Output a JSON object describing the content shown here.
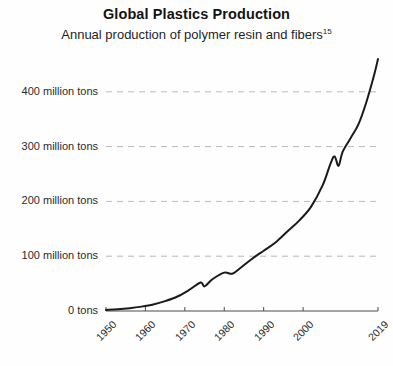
{
  "header": {
    "title": "Global Plastics Production",
    "subtitle_text": "Annual production of polymer resin and fibers",
    "subtitle_footnote": "15"
  },
  "colors": {
    "line": "#1a1a1a",
    "grid": "#b9b9b9",
    "axis": "#4a4a4a",
    "background": "#fefefe",
    "text": "#1f1f1f"
  },
  "chart_data": {
    "type": "line",
    "title": "Global Plastics Production",
    "subtitle": "Annual production of polymer resin and fibers",
    "xlabel": "",
    "ylabel": "",
    "xlim": [
      1950,
      2019
    ],
    "ylim": [
      0,
      460
    ],
    "grid": true,
    "legend": null,
    "y_tick_values": [
      0,
      100,
      200,
      300,
      400
    ],
    "y_tick_labels": [
      "0 tons",
      "100 million tons",
      "200 million tons",
      "300 million tons",
      "400 million tons"
    ],
    "x_tick_values": [
      1950,
      1960,
      1970,
      1980,
      1990,
      2000,
      2019
    ],
    "x_tick_labels": [
      "1950",
      "1960",
      "1970",
      "1980",
      "1990",
      "2000",
      "2019"
    ],
    "units": "million tons",
    "series": [
      {
        "name": "Global plastics production",
        "x": [
          1950,
          1953,
          1956,
          1959,
          1962,
          1965,
          1968,
          1971,
          1974,
          1975,
          1977,
          1980,
          1982,
          1984,
          1987,
          1990,
          1993,
          1996,
          1999,
          2002,
          2005,
          2007,
          2008,
          2009,
          2010,
          2012,
          2014,
          2016,
          2018,
          2019
        ],
        "values": [
          2,
          3,
          5,
          8,
          12,
          18,
          26,
          38,
          52,
          45,
          58,
          70,
          68,
          78,
          95,
          110,
          125,
          145,
          165,
          190,
          230,
          270,
          282,
          265,
          290,
          315,
          340,
          380,
          430,
          460
        ]
      }
    ]
  }
}
